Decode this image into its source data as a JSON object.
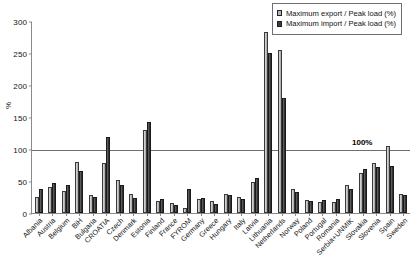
{
  "chart_data": {
    "type": "bar",
    "title": "",
    "xlabel": "",
    "ylabel": "%",
    "ylim": [
      0,
      300
    ],
    "yticks": [
      0,
      50,
      100,
      150,
      200,
      250,
      300
    ],
    "grid": false,
    "legend_position": "top-right",
    "annotations": [
      {
        "text": "100%",
        "y": 100,
        "note": "horizontal reference line at 100 percent"
      }
    ],
    "categories": [
      "Albania",
      "Austria",
      "Belgium",
      "BiH",
      "Bulgaria",
      "CROATIA",
      "Czech",
      "Denmark",
      "Estonia",
      "Finland",
      "France",
      "FYROM",
      "Germany",
      "Greece",
      "Hungary",
      "Italy",
      "Latvia",
      "Lithuania",
      "Netherlands",
      "Norway",
      "Poland",
      "Portugal",
      "Romania",
      "Serbia+UNMIK",
      "Slovakia",
      "Slovenia",
      "Spain",
      "Sweden"
    ],
    "series": [
      {
        "name": "Maximum export / Peak load (%)",
        "color": "#b4b4b4",
        "values": [
          25,
          40,
          34,
          80,
          28,
          78,
          52,
          29,
          130,
          18,
          16,
          8,
          22,
          19,
          30,
          25,
          48,
          283,
          255,
          38,
          20,
          17,
          17,
          44,
          62,
          78,
          105,
          30
        ]
      },
      {
        "name": "Maximum import / Peak load (%)",
        "color": "#3c3c3c",
        "values": [
          37,
          47,
          44,
          65,
          25,
          118,
          44,
          23,
          142,
          22,
          13,
          38,
          24,
          14,
          28,
          22,
          55,
          250,
          180,
          33,
          19,
          20,
          22,
          38,
          68,
          72,
          73,
          28
        ]
      }
    ]
  },
  "legend": {
    "items": [
      {
        "label": "Maximum export / Peak load (%)",
        "swatch": "export"
      },
      {
        "label": "Maximum import / Peak load (%)",
        "swatch": "import"
      }
    ]
  }
}
